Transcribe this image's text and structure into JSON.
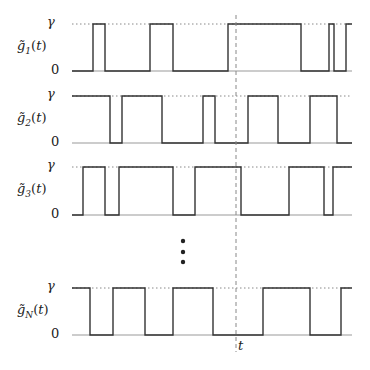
{
  "diagram": {
    "type": "telegraph-signals",
    "time_marker_label": "t",
    "level_high_label": "γ",
    "level_low_label": "0",
    "ellipsis": "⋮",
    "colors": {
      "signal": "#333333",
      "dotted": "#888888",
      "dashed": "#888888",
      "text": "#222222"
    },
    "rows": [
      {
        "label_base": "g̃",
        "label_sub": "1",
        "label_arg": "(t)",
        "y_high": 24,
        "y_low": 71,
        "start_level": 0,
        "transitions": [
          93,
          105,
          150,
          173,
          228,
          301,
          329,
          334,
          346
        ]
      },
      {
        "label_base": "g̃",
        "label_sub": "2",
        "label_arg": "(t)",
        "y_high": 96,
        "y_low": 143,
        "start_level": 1,
        "transitions": [
          110,
          122,
          162,
          203,
          215,
          248,
          278,
          310,
          337
        ]
      },
      {
        "label_base": "g̃",
        "label_sub": "3",
        "label_arg": "(t)",
        "y_high": 167,
        "y_low": 215,
        "start_level": 0,
        "transitions": [
          83,
          105,
          119,
          173,
          195,
          241,
          289,
          324,
          333
        ]
      },
      {
        "label_base": "g̃",
        "label_sub": "N",
        "label_arg": "(t)",
        "y_high": 288,
        "y_low": 335,
        "start_level": 1,
        "transitions": [
          90,
          113,
          145,
          173,
          213,
          263,
          310,
          341
        ]
      }
    ],
    "x_start": 72,
    "x_end": 352,
    "marker_x": 236
  }
}
